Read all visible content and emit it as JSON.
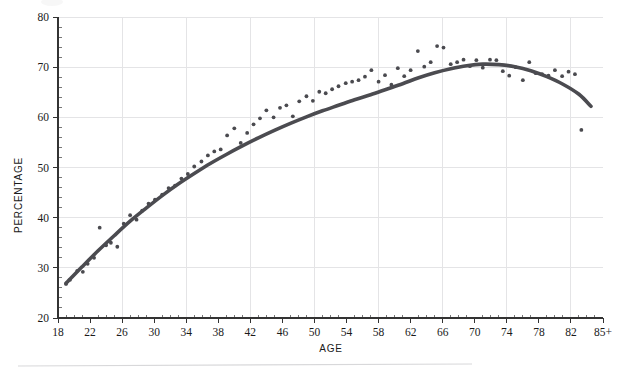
{
  "chart_data": {
    "type": "scatter",
    "title": "",
    "subtitle": "",
    "xlabel": "AGE",
    "ylabel": "PERCENTAGE",
    "xlim": [
      18,
      86
    ],
    "ylim": [
      20,
      80
    ],
    "grid": true,
    "legend": false,
    "legend_position": "none",
    "x_tick_labels": [
      "18",
      "22",
      "26",
      "30",
      "34",
      "38",
      "42",
      "46",
      "50",
      "54",
      "58",
      "62",
      "66",
      "70",
      "74",
      "78",
      "82",
      "85+"
    ],
    "x_tick_values": [
      18,
      22,
      26,
      30,
      34,
      38,
      42,
      46,
      50,
      54,
      58,
      62,
      66,
      70,
      74,
      78,
      82,
      86
    ],
    "x_minor_tick_step": 1,
    "x_gridline_values": [
      18,
      26,
      34,
      42,
      50,
      58,
      66,
      74,
      82
    ],
    "y_tick_labels": [
      "20",
      "30",
      "40",
      "50",
      "60",
      "70",
      "80"
    ],
    "y_tick_values": [
      20,
      30,
      40,
      50,
      60,
      70,
      80
    ],
    "y_minor_tick_step": 2,
    "y_gridline_values": [
      30,
      40,
      50,
      60,
      70,
      80
    ],
    "colors": {
      "point": "#4a4a4f",
      "curve": "#4b4b50",
      "grid": "#e4e4e6",
      "axis": "#333333",
      "text": "#1a1a1a",
      "background": "#ffffff"
    },
    "point_radius": 1.9,
    "curve_width": 3.6,
    "series": [
      {
        "name": "observed",
        "type": "scatter",
        "x": [
          19.0,
          19.5,
          20.4,
          21.1,
          21.7,
          22.5,
          23.2,
          24.0,
          24.6,
          25.4,
          26.2,
          27.0,
          27.8,
          28.5,
          29.3,
          30.1,
          31.0,
          31.8,
          32.6,
          33.4,
          34.2,
          35.0,
          35.9,
          36.7,
          37.5,
          38.3,
          39.1,
          40.0,
          40.8,
          41.6,
          42.4,
          43.2,
          44.0,
          44.9,
          45.7,
          46.5,
          47.3,
          48.1,
          49.0,
          49.8,
          50.6,
          51.4,
          52.2,
          53.0,
          53.9,
          54.7,
          55.5,
          56.3,
          57.1,
          58.0,
          58.8,
          59.6,
          60.4,
          61.2,
          62.0,
          62.9,
          63.7,
          64.5,
          65.3,
          66.1,
          67.0,
          67.8,
          68.6,
          69.4,
          70.2,
          71.0,
          71.9,
          72.7,
          73.5,
          74.3,
          75.1,
          76.0,
          76.8,
          77.6,
          78.4,
          79.2,
          80.0,
          80.9,
          81.7,
          82.5,
          83.3
        ],
        "y": [
          26.8,
          27.6,
          29.4,
          29.2,
          30.8,
          32.0,
          38.0,
          34.5,
          35.0,
          34.2,
          38.8,
          40.5,
          39.6,
          41.4,
          42.8,
          43.6,
          44.6,
          45.9,
          46.4,
          47.8,
          48.7,
          50.2,
          51.2,
          52.4,
          53.2,
          53.6,
          56.4,
          57.8,
          54.9,
          56.9,
          58.6,
          59.8,
          61.4,
          60.0,
          61.9,
          62.4,
          60.2,
          63.2,
          64.2,
          63.3,
          65.1,
          64.8,
          65.6,
          66.2,
          66.8,
          67.1,
          67.4,
          68.1,
          69.4,
          67.1,
          68.4,
          66.5,
          69.8,
          68.2,
          69.4,
          73.2,
          70.1,
          71.0,
          74.2,
          73.9,
          70.6,
          71.0,
          71.5,
          70.2,
          71.4,
          69.9,
          71.5,
          71.4,
          69.2,
          68.3,
          70.0,
          67.4,
          71.0,
          68.8,
          68.6,
          68.3,
          69.4,
          68.2,
          69.1,
          68.6,
          57.5
        ]
      },
      {
        "name": "smoothed fit",
        "type": "line",
        "x": [
          19.0,
          21.0,
          23.0,
          25.0,
          27.0,
          29.0,
          31.0,
          33.0,
          35.0,
          37.0,
          39.0,
          41.0,
          43.0,
          45.0,
          47.0,
          49.0,
          51.0,
          53.0,
          55.0,
          57.0,
          59.0,
          61.0,
          63.0,
          65.0,
          67.0,
          69.0,
          71.0,
          73.0,
          75.0,
          77.0,
          79.0,
          81.0,
          83.0,
          84.5
        ],
        "y": [
          26.9,
          30.2,
          33.4,
          36.4,
          39.3,
          41.9,
          44.4,
          46.7,
          48.8,
          50.8,
          52.6,
          54.3,
          55.9,
          57.4,
          58.8,
          60.1,
          61.3,
          62.4,
          63.5,
          64.5,
          65.6,
          66.7,
          67.9,
          68.9,
          69.7,
          70.3,
          70.6,
          70.5,
          70.1,
          69.3,
          68.1,
          66.6,
          64.6,
          62.2
        ]
      }
    ]
  },
  "figure": {
    "footer_rule_visible": true
  }
}
